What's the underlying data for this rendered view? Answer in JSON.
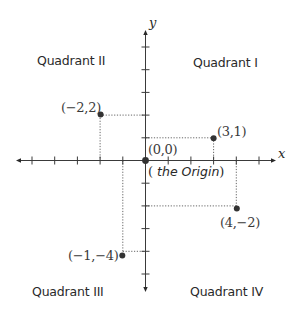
{
  "diagram": {
    "axes": {
      "x_label": "x",
      "y_label": "y",
      "origin_px": [
        145.5,
        160.5
      ],
      "unit_px": 22.7,
      "x_ticks": [
        -5,
        -4,
        -3,
        -2,
        -1,
        1,
        2,
        3,
        4,
        5
      ],
      "y_ticks": [
        5,
        4,
        3,
        2,
        1,
        -1,
        -2,
        -3,
        -4,
        -5
      ],
      "line_color": "#3a3a3a"
    },
    "quadrants": {
      "q1": "Quadrant I",
      "q2": "Quadrant II",
      "q3": "Quadrant III",
      "q4": "Quadrant IV"
    },
    "origin": {
      "label": "(0,0)",
      "note_open": "(",
      "note_text": " the Origin",
      "note_close": ")"
    },
    "points": [
      {
        "label": "(−2,2)",
        "x": -2,
        "y": 2
      },
      {
        "label": "(3,1)",
        "x": 3,
        "y": 1
      },
      {
        "label": "(4,−2)",
        "x": 4,
        "y": -2
      },
      {
        "label": "(−1,−4)",
        "x": -1,
        "y": -4
      }
    ],
    "point_color": "#333333",
    "guide_color": "#555555"
  }
}
